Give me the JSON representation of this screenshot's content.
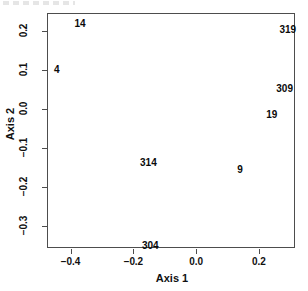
{
  "chart_data": {
    "type": "scatter",
    "title": "",
    "xlabel": "Axis 1",
    "ylabel": "Axis 2",
    "xlim": [
      -0.475,
      0.315
    ],
    "ylim": [
      -0.355,
      0.245
    ],
    "grid": false,
    "legend": null,
    "xticks": [
      "-0.4",
      "-0.2",
      "0.0",
      "0.2"
    ],
    "xtick_values": [
      -0.4,
      -0.2,
      0.0,
      0.2
    ],
    "yticks": [
      "0.2",
      "0.1",
      "0.0",
      "-0.1",
      "-0.2",
      "-0.3"
    ],
    "ytick_values": [
      0.2,
      0.1,
      0.0,
      -0.1,
      -0.2,
      -0.3
    ],
    "marker_style": "text-label",
    "points": [
      {
        "label": "14",
        "x": -0.37,
        "y": 0.217
      },
      {
        "label": "319",
        "x": 0.292,
        "y": 0.202
      },
      {
        "label": "4",
        "x": -0.444,
        "y": 0.1
      },
      {
        "label": "309",
        "x": 0.282,
        "y": 0.05
      },
      {
        "label": "19",
        "x": 0.241,
        "y": -0.016
      },
      {
        "label": "314",
        "x": -0.152,
        "y": -0.139
      },
      {
        "label": "9",
        "x": 0.14,
        "y": -0.155
      },
      {
        "label": "304",
        "x": -0.146,
        "y": -0.35
      }
    ]
  },
  "plot": {
    "x_axis_title": "Axis 1",
    "y_axis_title": "Axis 2"
  }
}
